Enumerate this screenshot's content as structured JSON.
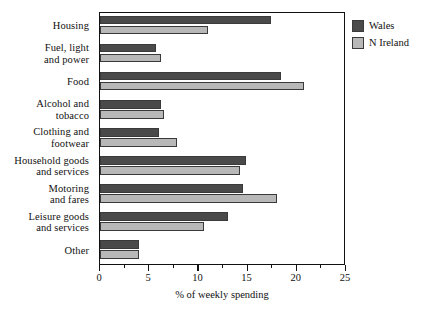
{
  "chart_data": {
    "type": "bar",
    "orientation": "horizontal",
    "title": "",
    "xlabel": "% of weekly spending",
    "ylabel": "",
    "xlim": [
      0,
      25
    ],
    "xticks": [
      0,
      5,
      10,
      15,
      20,
      25
    ],
    "xtick_labels": [
      "0",
      "5",
      "10",
      "15",
      "20",
      "25"
    ],
    "minor_tick_interval": 2.5,
    "grid": false,
    "legend_position": "right-outside",
    "categories": [
      "Housing",
      "Fuel, light\nand power",
      "Food",
      "Alcohol and\ntobacco",
      "Clothing and\nfootwear",
      "Household goods\nand services",
      "Motoring\nand fares",
      "Leisure goods\nand services",
      "Other"
    ],
    "series": [
      {
        "name": "Wales",
        "color": "#4a4a4a",
        "values": [
          17.4,
          5.7,
          18.4,
          6.2,
          6.0,
          14.8,
          14.5,
          13.0,
          4.0
        ]
      },
      {
        "name": "N Ireland",
        "color": "#b8b8b8",
        "values": [
          11.0,
          6.2,
          20.7,
          6.5,
          7.8,
          14.2,
          18.0,
          10.6,
          4.0
        ]
      }
    ]
  },
  "legend": {
    "items": [
      {
        "label": "Wales",
        "color": "#4a4a4a"
      },
      {
        "label": "N Ireland",
        "color": "#b8b8b8"
      }
    ]
  },
  "colors": {
    "wales": "#4a4a4a",
    "n_ireland": "#b8b8b8",
    "bar_outline": "#3a3a3a",
    "axis": "#111111",
    "background": "#ffffff"
  }
}
